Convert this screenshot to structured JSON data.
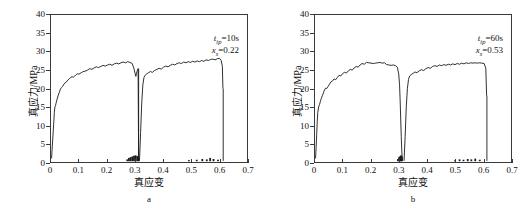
{
  "figure": {
    "panel_captions": [
      "a",
      "b"
    ]
  },
  "axes": {
    "xlabel": "真应变",
    "ylabel": "真应力/MPa",
    "xticks": [
      0,
      0.1,
      0.2,
      0.3,
      0.4,
      0.5,
      0.6,
      0.7
    ],
    "xtick_labels": [
      "0",
      "0.1",
      "0.2",
      "0.3",
      "0.4",
      "0.5",
      "0.6",
      "0.7"
    ],
    "yticks": [
      0,
      5,
      10,
      15,
      20,
      25,
      30,
      35,
      40
    ],
    "ytick_labels": [
      "0",
      "5",
      "10",
      "15",
      "20",
      "25",
      "30",
      "35",
      "40"
    ],
    "xlim": [
      0,
      0.7
    ],
    "ylim": [
      0,
      40
    ],
    "grid": false
  },
  "panel_a": {
    "caption": "a",
    "annotation_1_symbol": "t",
    "annotation_1_sub": "ip",
    "annotation_1_value": "=10s",
    "annotation_2_symbol": "x",
    "annotation_2_sub": "s",
    "annotation_2_value": "=0.22"
  },
  "panel_b": {
    "caption": "b",
    "annotation_1_symbol": "t",
    "annotation_1_sub": "ip",
    "annotation_1_value": "=60s",
    "annotation_2_symbol": "x",
    "annotation_2_sub": "s",
    "annotation_2_value": "=0.53"
  },
  "colors": {
    "curve": "#1a1a1a",
    "axis": "#3a3a3a",
    "background": "#ffffff"
  },
  "chart_data": [
    {
      "type": "line",
      "title": "",
      "subtitle": "a",
      "xlabel": "真应变",
      "ylabel": "真应力/MPa",
      "xlim": [
        0,
        0.7
      ],
      "ylim": [
        0,
        40
      ],
      "grid": false,
      "legend": null,
      "annotations": [
        "t_ip=10s",
        "x_s=0.22"
      ],
      "series": [
        {
          "name": "loading-segment-1",
          "x": [
            0.002,
            0.004,
            0.006,
            0.008,
            0.01,
            0.012,
            0.014,
            0.016,
            0.018,
            0.02,
            0.023,
            0.026,
            0.03,
            0.034,
            0.038,
            0.042,
            0.046,
            0.05,
            0.055,
            0.06,
            0.065,
            0.07,
            0.075,
            0.08,
            0.085,
            0.09,
            0.095,
            0.1,
            0.108,
            0.115,
            0.122,
            0.13,
            0.138,
            0.146,
            0.154,
            0.162,
            0.17,
            0.178,
            0.186,
            0.194,
            0.202,
            0.21,
            0.218,
            0.226,
            0.234,
            0.242,
            0.25,
            0.258,
            0.266,
            0.274,
            0.282,
            0.29,
            0.296,
            0.3,
            0.303,
            0.305,
            0.307,
            0.309,
            0.311,
            0.313
          ],
          "y": [
            1.0,
            3.5,
            6.0,
            8.5,
            11.0,
            13.5,
            15.0,
            15.3,
            16.0,
            16.6,
            17.4,
            18.2,
            19.0,
            19.9,
            20.3,
            20.6,
            21.2,
            21.5,
            21.8,
            22.3,
            22.6,
            23.0,
            23.2,
            23.1,
            23.4,
            23.8,
            24.0,
            23.9,
            24.3,
            24.6,
            24.7,
            25.0,
            25.4,
            25.2,
            25.6,
            25.9,
            25.7,
            26.0,
            26.3,
            26.1,
            26.4,
            26.6,
            26.3,
            26.7,
            26.9,
            26.7,
            27.0,
            27.2,
            27.0,
            27.3,
            27.1,
            26.8,
            25.5,
            24.2,
            23.3,
            24.0,
            24.6,
            25.0,
            25.4,
            0.4
          ]
        },
        {
          "name": "unload-drop-1",
          "x": [
            0.313,
            0.313
          ],
          "y": [
            25.4,
            0.3
          ]
        },
        {
          "name": "loading-segment-2",
          "x": [
            0.316,
            0.32,
            0.324,
            0.328,
            0.332,
            0.336,
            0.342,
            0.348,
            0.355,
            0.362,
            0.37,
            0.378,
            0.386,
            0.394,
            0.402,
            0.41,
            0.418,
            0.426,
            0.434,
            0.442,
            0.45,
            0.458,
            0.466,
            0.474,
            0.482,
            0.49,
            0.498,
            0.506,
            0.514,
            0.522,
            0.53,
            0.538,
            0.546,
            0.554,
            0.562,
            0.57,
            0.578,
            0.586,
            0.594,
            0.602,
            0.608,
            0.612,
            0.614
          ],
          "y": [
            0.3,
            8.0,
            16.0,
            21.0,
            23.0,
            23.6,
            24.0,
            24.3,
            24.6,
            24.4,
            24.9,
            25.2,
            25.5,
            25.3,
            25.8,
            26.1,
            25.9,
            26.3,
            26.6,
            26.4,
            26.8,
            27.0,
            26.8,
            27.2,
            27.0,
            27.3,
            27.1,
            27.4,
            27.2,
            27.5,
            27.3,
            27.6,
            27.4,
            27.8,
            27.6,
            27.9,
            28.0,
            27.8,
            28.1,
            28.2,
            27.6,
            26.0,
            20.0
          ]
        },
        {
          "name": "unload-drop-2",
          "x": [
            0.615,
            0.615
          ],
          "y": [
            20.0,
            0.3
          ]
        },
        {
          "name": "baseline-noise",
          "x": [
            0.272,
            0.278,
            0.284,
            0.29,
            0.296,
            0.302,
            0.308,
            0.312,
            0.492,
            0.52,
            0.54,
            0.556,
            0.568,
            0.58,
            0.596
          ],
          "y": [
            0.5,
            0.9,
            1.1,
            1.3,
            1.5,
            1.6,
            1.4,
            0.8,
            0.3,
            0.4,
            0.6,
            0.5,
            0.9,
            0.6,
            0.4
          ]
        }
      ]
    },
    {
      "type": "line",
      "title": "",
      "subtitle": "b",
      "xlabel": "真应变",
      "ylabel": "真应力/MPa",
      "xlim": [
        0,
        0.7
      ],
      "ylim": [
        0,
        40
      ],
      "grid": false,
      "legend": null,
      "annotations": [
        "t_ip=60s",
        "x_s=0.53"
      ],
      "series": [
        {
          "name": "loading-segment-1",
          "x": [
            0.002,
            0.004,
            0.006,
            0.008,
            0.01,
            0.013,
            0.016,
            0.019,
            0.022,
            0.026,
            0.03,
            0.034,
            0.038,
            0.042,
            0.047,
            0.052,
            0.057,
            0.062,
            0.068,
            0.074,
            0.08,
            0.086,
            0.092,
            0.098,
            0.105,
            0.112,
            0.119,
            0.126,
            0.133,
            0.14,
            0.147,
            0.154,
            0.161,
            0.168,
            0.176,
            0.184,
            0.192,
            0.2,
            0.208,
            0.216,
            0.224,
            0.232,
            0.24,
            0.248,
            0.256,
            0.264,
            0.272,
            0.28,
            0.288,
            0.294,
            0.299,
            0.302,
            0.304,
            0.306,
            0.308,
            0.31,
            0.312
          ],
          "y": [
            1.0,
            4.0,
            7.5,
            11.0,
            13.5,
            15.0,
            15.6,
            16.4,
            17.2,
            18.0,
            18.8,
            19.6,
            20.1,
            20.0,
            20.6,
            21.2,
            21.8,
            22.0,
            22.6,
            22.4,
            23.0,
            23.6,
            23.4,
            24.0,
            24.4,
            24.2,
            24.8,
            25.2,
            25.0,
            25.6,
            26.0,
            25.8,
            26.4,
            26.8,
            26.6,
            27.1,
            27.0,
            26.9,
            26.8,
            26.9,
            27.0,
            27.1,
            26.9,
            27.0,
            26.5,
            26.4,
            26.3,
            26.4,
            26.2,
            25.8,
            24.0,
            21.0,
            17.0,
            12.0,
            7.0,
            3.0,
            0.5
          ]
        },
        {
          "name": "unload-drop-1",
          "x": [
            0.312,
            0.312
          ],
          "y": [
            0.5,
            0.3
          ]
        },
        {
          "name": "loading-segment-2",
          "x": [
            0.318,
            0.322,
            0.326,
            0.33,
            0.334,
            0.338,
            0.344,
            0.35,
            0.357,
            0.364,
            0.372,
            0.38,
            0.388,
            0.396,
            0.404,
            0.412,
            0.42,
            0.428,
            0.436,
            0.444,
            0.452,
            0.46,
            0.468,
            0.476,
            0.484,
            0.492,
            0.5,
            0.508,
            0.516,
            0.524,
            0.532,
            0.54,
            0.548,
            0.556,
            0.564,
            0.572,
            0.58,
            0.588,
            0.596,
            0.604,
            0.61,
            0.613
          ],
          "y": [
            0.3,
            7.0,
            15.0,
            20.0,
            22.5,
            23.4,
            23.8,
            24.1,
            24.5,
            24.3,
            24.8,
            25.1,
            24.9,
            25.4,
            25.7,
            25.5,
            26.0,
            26.2,
            26.0,
            26.4,
            26.2,
            26.5,
            26.3,
            26.6,
            26.4,
            26.7,
            26.5,
            26.8,
            26.6,
            26.9,
            26.7,
            27.0,
            26.8,
            27.0,
            26.9,
            27.0,
            26.9,
            27.0,
            26.9,
            26.8,
            25.5,
            18.0
          ]
        },
        {
          "name": "unload-drop-2",
          "x": [
            0.614,
            0.614
          ],
          "y": [
            18.0,
            0.3
          ]
        },
        {
          "name": "baseline-noise",
          "x": [
            0.296,
            0.3,
            0.304,
            0.307,
            0.31,
            0.5,
            0.516,
            0.53,
            0.545,
            0.558,
            0.572,
            0.588
          ],
          "y": [
            0.6,
            1.1,
            1.4,
            1.6,
            1.2,
            0.3,
            0.5,
            0.4,
            0.6,
            0.5,
            0.7,
            0.4
          ]
        }
      ]
    }
  ]
}
